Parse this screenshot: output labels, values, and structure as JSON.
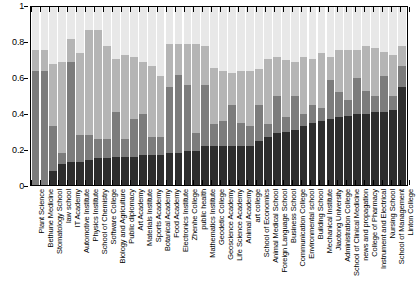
{
  "chart_data": {
    "type": "bar",
    "subtype": "stacked-bar-100-percent",
    "title": "",
    "xlabel": "",
    "ylabel": "",
    "ylim": [
      0,
      1
    ],
    "yticks": [
      0,
      0.2,
      0.4,
      0.6,
      0.8,
      1
    ],
    "ytick_labels": [
      "0",
      "0.2",
      "0.4",
      "0.6",
      "0.8",
      "1"
    ],
    "grid": false,
    "legend": "none",
    "orientation": "vertical",
    "stack_order": "bottom-to-top",
    "categories": [
      "Plant Science",
      "Bethune Medicine",
      "Stomatology School",
      "law school",
      "IT Academy",
      "Automotive Institute",
      "Physics Institute",
      "School of Chemistry",
      "Software College",
      "Biology and Agriculture",
      "Public diplomacy",
      "Art Academy",
      "Materials Institute",
      "Sports Academy",
      "Botanical Academy",
      "Food Academy",
      "Electronics Institute",
      "Zhenhe College",
      "public health",
      "Mathematics Institute",
      "Geodetic College",
      "Geoscience Academy",
      "Life Science Academy",
      "Animal Academy",
      "art college",
      "School of Economics",
      "Animal Medical School",
      "Foreign Language School",
      "Business School",
      "Communication College",
      "Environmental school",
      "Building School",
      "Mechanical Institute",
      "Jiaotong University",
      "Administration College",
      "School of Clinical Medicine",
      "news and propagation",
      "College of Pharmacy",
      "Instrument and Electrical",
      "Nursing School",
      "School of Management",
      "Linton College"
    ],
    "series": [
      {
        "name": "segment-1-dark",
        "color": "#2e2e2e",
        "values": [
          0.0,
          0.0,
          0.08,
          0.12,
          0.13,
          0.13,
          0.14,
          0.15,
          0.15,
          0.16,
          0.16,
          0.16,
          0.17,
          0.17,
          0.17,
          0.18,
          0.18,
          0.19,
          0.19,
          0.22,
          0.22,
          0.22,
          0.22,
          0.22,
          0.22,
          0.25,
          0.27,
          0.29,
          0.3,
          0.31,
          0.33,
          0.35,
          0.36,
          0.37,
          0.38,
          0.39,
          0.4,
          0.4,
          0.41,
          0.41,
          0.42,
          0.55
        ]
      },
      {
        "name": "segment-2-mid-gray",
        "color": "#7c7c7c",
        "values": [
          0.64,
          0.64,
          0.25,
          0.06,
          0.56,
          0.15,
          0.14,
          0.11,
          0.11,
          0.25,
          0.1,
          0.21,
          0.23,
          0.1,
          0.1,
          0.37,
          0.44,
          0.37,
          0.1,
          0.34,
          0.12,
          0.14,
          0.23,
          0.13,
          0.11,
          0.2,
          0.07,
          0.21,
          0.08,
          0.19,
          0.07,
          0.1,
          0.07,
          0.22,
          0.14,
          0.09,
          0.2,
          0.13,
          0.09,
          0.2,
          0.08,
          0.12
        ]
      },
      {
        "name": "segment-3-light-gray",
        "color": "#b5b5b5",
        "values": [
          0.12,
          0.12,
          0.35,
          0.51,
          0.13,
          0.46,
          0.59,
          0.61,
          0.52,
          0.3,
          0.47,
          0.35,
          0.29,
          0.4,
          0.34,
          0.24,
          0.17,
          0.23,
          0.5,
          0.22,
          0.32,
          0.28,
          0.18,
          0.29,
          0.31,
          0.2,
          0.37,
          0.22,
          0.32,
          0.19,
          0.32,
          0.26,
          0.31,
          0.13,
          0.24,
          0.28,
          0.16,
          0.25,
          0.27,
          0.14,
          0.23,
          0.11
        ]
      },
      {
        "name": "segment-4-very-light",
        "color": "#e8e8e8",
        "values": [
          0.24,
          0.24,
          0.32,
          0.31,
          0.18,
          0.26,
          0.13,
          0.13,
          0.22,
          0.29,
          0.27,
          0.28,
          0.31,
          0.33,
          0.39,
          0.21,
          0.21,
          0.21,
          0.21,
          0.22,
          0.34,
          0.36,
          0.37,
          0.36,
          0.36,
          0.35,
          0.29,
          0.28,
          0.3,
          0.31,
          0.28,
          0.29,
          0.26,
          0.28,
          0.24,
          0.24,
          0.24,
          0.22,
          0.23,
          0.25,
          0.27,
          0.22
        ]
      }
    ]
  }
}
